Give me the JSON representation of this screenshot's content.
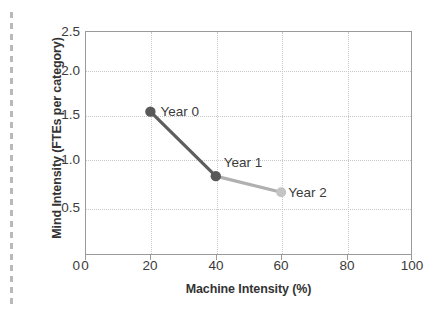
{
  "figure": {
    "name": "mind-intensity-vs-machine-intensity-scatter-line"
  },
  "chart_data": {
    "type": "line",
    "title": "",
    "subtitle": "",
    "xlabel": "Machine Intensity (%)",
    "ylabel": "Mind Intensity (FTEs per category)",
    "xlim": [
      0,
      100
    ],
    "ylim": [
      0,
      2.5
    ],
    "xticks": [
      0,
      20,
      40,
      60,
      80,
      100
    ],
    "xticklabels": [
      "0",
      "20",
      "40",
      "60",
      "80",
      "100"
    ],
    "yticks": [
      0,
      0.5,
      1.0,
      1.5,
      2.0,
      2.5
    ],
    "yticklabels": [
      "0",
      "0.5",
      "1.0",
      "1.5",
      "2.0",
      "2.5"
    ],
    "grid": true,
    "grid_style": "dotted",
    "legend": "none",
    "legend_position": "inline-annotations",
    "x": [
      20,
      40,
      60
    ],
    "values": [
      1.6,
      0.88,
      0.7
    ],
    "series": [
      {
        "name": "Mind Intensity trajectory",
        "points": [
          {
            "label": "Year 0",
            "x": 20,
            "y": 1.6,
            "color": "#595959"
          },
          {
            "label": "Year 1",
            "x": 40,
            "y": 0.88,
            "color": "#595959"
          },
          {
            "label": "Year 2",
            "x": 60,
            "y": 0.7,
            "color": "#c4c4c4"
          }
        ],
        "segment_colors": [
          "#5e5e5e",
          "#b0b0b0"
        ]
      }
    ],
    "annotations": [
      {
        "text": "Year 0",
        "x": 20,
        "y": 1.6
      },
      {
        "text": "Year 1",
        "x": 40,
        "y": 0.88
      },
      {
        "text": "Year 2",
        "x": 60,
        "y": 0.7
      }
    ]
  },
  "axes": {
    "y_title": "Mind Intensity (FTEs per category)",
    "x_title": "Machine Intensity (%)",
    "y_labels": [
      "2.5",
      "2.0",
      "1.5",
      "1.0",
      "0.5",
      "0"
    ],
    "x_labels": [
      "0",
      "20",
      "40",
      "60",
      "80",
      "100"
    ]
  },
  "annotations": {
    "year0": "Year 0",
    "year1": "Year 1",
    "year2": "Year 2"
  },
  "colors": {
    "frame": "#9a9a9a",
    "grid": "#c8c8c8",
    "marker_dark": "#595959",
    "marker_light": "#c4c4c4",
    "segment_1": "#5e5e5e",
    "segment_2": "#b0b0b0",
    "text": "#3b3b3b",
    "page_edge": "#b9b9b9"
  }
}
